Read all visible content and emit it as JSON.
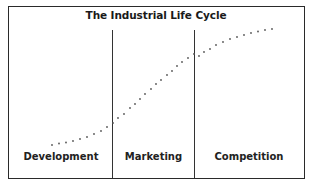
{
  "diagram": {
    "title": "The Industrial Life Cycle",
    "stages": [
      {
        "label": "Development"
      },
      {
        "label": "Marketing"
      },
      {
        "label": "Competition"
      }
    ],
    "curve": {
      "style": "dotted",
      "shape": "S-curve",
      "color": "#555555"
    },
    "colors": {
      "border": "#2a2a2a",
      "text": "#222222",
      "background": "#ffffff"
    }
  }
}
